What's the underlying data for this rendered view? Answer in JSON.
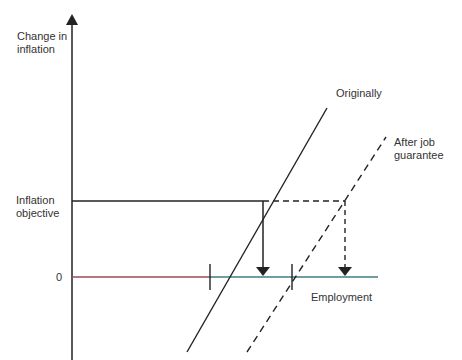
{
  "diagram": {
    "y_axis_label_line1": "Change in",
    "y_axis_label_line2": "inflation",
    "inflation_objective_line1": "Inflation",
    "inflation_objective_line2": "objective",
    "zero_label": "0",
    "x_axis_label": "Employment",
    "curve_original_label": "Originally",
    "curve_after_label_line1": "After job",
    "curve_after_label_line2": "guarantee",
    "colors": {
      "line": "#222222",
      "axis_left_segment": "#b04050",
      "axis_right_segment": "#2f7f7a"
    }
  }
}
